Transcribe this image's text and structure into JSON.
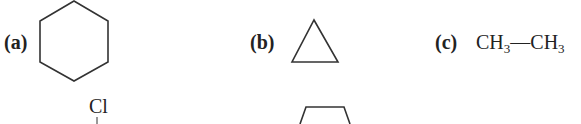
{
  "options": [
    {
      "label": "(a)",
      "structure": "cyclohexane (hexagon skeletal)"
    },
    {
      "label": "(b)",
      "structure": "cyclopropane (triangle skeletal)"
    },
    {
      "label": "(c)",
      "formula_parts": {
        "g1": "CH",
        "s1": "3",
        "bond": "—",
        "g2": "CH",
        "s2": "3"
      }
    }
  ],
  "partial": {
    "substituent": "Cl",
    "structure": "pentagon (partially visible)"
  }
}
